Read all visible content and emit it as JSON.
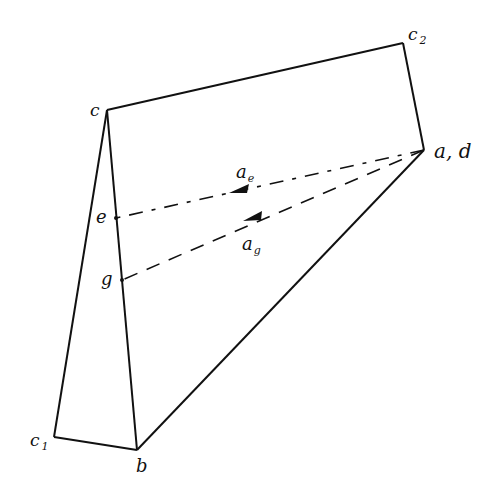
{
  "diagram": {
    "type": "acceleration polygon",
    "stroke_color": "#111111",
    "background": "#ffffff",
    "points": {
      "c": {
        "label": "c",
        "sub": "",
        "x": 107,
        "y": 110
      },
      "c2": {
        "label": "c",
        "sub": "2",
        "x": 403,
        "y": 43
      },
      "ad": {
        "label": "a, d",
        "sub": "",
        "x": 424,
        "y": 150
      },
      "b": {
        "label": "b",
        "sub": "",
        "x": 137,
        "y": 450
      },
      "c1": {
        "label": "c",
        "sub": "1",
        "x": 54,
        "y": 437
      },
      "e": {
        "label": "e",
        "sub": "",
        "x": 116,
        "y": 218
      },
      "g": {
        "label": "g",
        "sub": "",
        "x": 122,
        "y": 280
      }
    },
    "solid_edges": [
      [
        "c",
        "c2"
      ],
      [
        "c2",
        "ad"
      ],
      [
        "ad",
        "b"
      ],
      [
        "b",
        "c1"
      ],
      [
        "c1",
        "c"
      ],
      [
        "c",
        "b"
      ]
    ],
    "vectors": [
      {
        "name": "a_e",
        "label": "a",
        "sub": "e",
        "from": "ad",
        "to": "e",
        "style": "dash-dot"
      },
      {
        "name": "a_g",
        "label": "a",
        "sub": "g",
        "from": "ad",
        "to": "g",
        "style": "dashed"
      }
    ]
  }
}
